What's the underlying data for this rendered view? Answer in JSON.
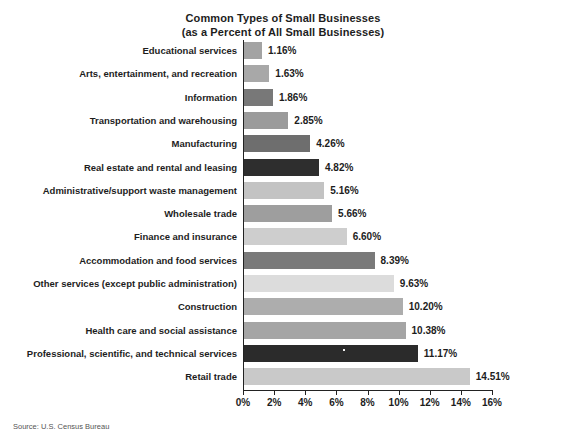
{
  "title": {
    "line1": "Common Types of Small Businesses",
    "line2": "(as a Percent of All Small Businesses)"
  },
  "source": "Source: U.S. Census Bureau",
  "chart_data": {
    "type": "bar",
    "orientation": "horizontal",
    "title": "Common Types of Small Businesses (as a Percent of All Small Businesses)",
    "xlabel": "",
    "ylabel": "",
    "xlim": [
      0,
      16
    ],
    "xticks": [
      0,
      2,
      4,
      6,
      8,
      10,
      12,
      14,
      16
    ],
    "xtick_labels": [
      "0%",
      "2%",
      "4%",
      "6%",
      "8%",
      "10%",
      "12%",
      "14%",
      "16%"
    ],
    "grid": false,
    "legend": "none",
    "value_suffix": "%",
    "categories": [
      "Educational services",
      "Arts, entertainment, and recreation",
      "Information",
      "Transportation and warehousing",
      "Manufacturing",
      "Real estate and rental and leasing",
      "Administrative/support waste management",
      "Wholesale trade",
      "Finance and insurance",
      "Accommodation and food services",
      "Other services (except public administration)",
      "Construction",
      "Health care and social assistance",
      "Professional, scientific, and technical services",
      "Retail trade"
    ],
    "values": [
      1.16,
      1.63,
      1.86,
      2.85,
      4.26,
      4.82,
      5.16,
      5.66,
      6.6,
      8.39,
      9.63,
      10.2,
      10.38,
      11.17,
      14.51
    ],
    "value_labels": [
      "1.16%",
      "1.63%",
      "1.86%",
      "2.85%",
      "4.26%",
      "4.82%",
      "5.16%",
      "5.66%",
      "6.60%",
      "8.39%",
      "9.63%",
      "10.20%",
      "10.38%",
      "11.17%",
      "14.51%"
    ],
    "bar_colors": [
      "#a3a3a3",
      "#a8a8a8",
      "#787878",
      "#9b9b9b",
      "#6e6e6e",
      "#2e2e2e",
      "#c3c3c3",
      "#9e9e9e",
      "#cecece",
      "#7a7a7a",
      "#dcdcdc",
      "#adadad",
      "#a5a5a5",
      "#2b2b2b",
      "#c9c9c9"
    ]
  }
}
